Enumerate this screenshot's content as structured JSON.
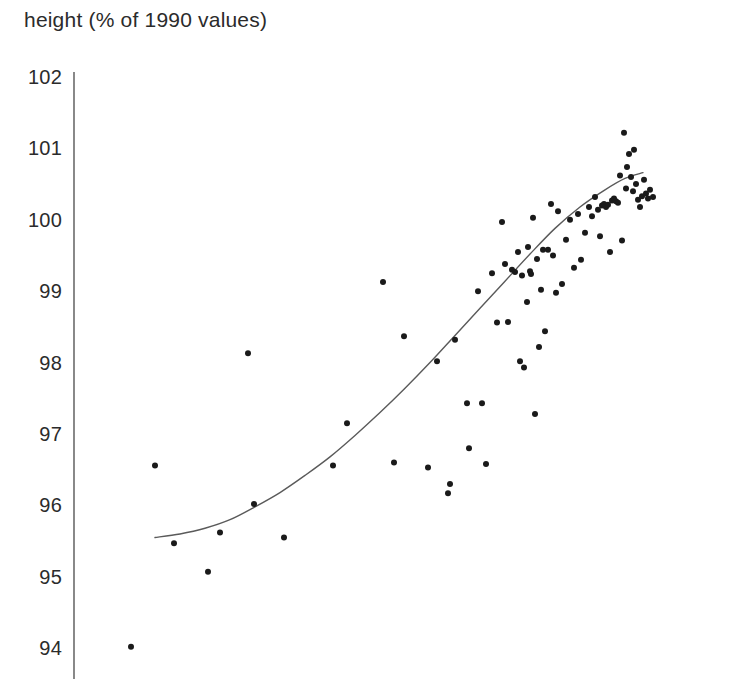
{
  "chart_data": {
    "type": "scatter",
    "title": "height (% of 1990 values)",
    "ylabel": "height (% of 1990 values)",
    "xlabel": "",
    "ylim": [
      93.6,
      102.3
    ],
    "yticks": [
      102,
      101,
      100,
      99,
      98,
      97,
      96,
      95,
      94
    ],
    "ytick_labels": [
      "102",
      "101",
      "100",
      "99",
      "98",
      "97",
      "96",
      "95",
      "94"
    ],
    "grid": false,
    "legend": null,
    "axis": {
      "y_axis_visible": true,
      "x_axis_visible": false,
      "x_ticks_visible": false
    },
    "marker": {
      "shape": "circle",
      "color": "#1a1a1a",
      "size_px": 6
    },
    "series": [
      {
        "name": "observations",
        "type": "scatter",
        "points": [
          [
            131,
            94.02
          ],
          [
            155,
            96.56
          ],
          [
            174,
            95.47
          ],
          [
            208,
            95.07
          ],
          [
            220,
            95.62
          ],
          [
            248,
            98.13
          ],
          [
            254,
            96.02
          ],
          [
            284,
            95.55
          ],
          [
            333,
            96.56
          ],
          [
            347,
            97.15
          ],
          [
            383,
            99.13
          ],
          [
            394,
            96.6
          ],
          [
            404,
            98.37
          ],
          [
            428,
            96.53
          ],
          [
            437,
            98.02
          ],
          [
            448,
            96.17
          ],
          [
            450,
            96.3
          ],
          [
            455,
            98.32
          ],
          [
            467,
            97.43
          ],
          [
            469,
            96.8
          ],
          [
            478,
            99.0
          ],
          [
            482,
            97.43
          ],
          [
            486,
            96.58
          ],
          [
            492,
            99.25
          ],
          [
            497,
            98.56
          ],
          [
            502,
            99.97
          ],
          [
            505,
            99.38
          ],
          [
            508,
            98.57
          ],
          [
            512,
            99.3
          ],
          [
            515,
            99.27
          ],
          [
            518,
            99.55
          ],
          [
            520,
            98.02
          ],
          [
            522,
            99.22
          ],
          [
            524,
            97.93
          ],
          [
            527,
            98.85
          ],
          [
            528,
            99.62
          ],
          [
            530,
            99.28
          ],
          [
            531,
            99.24
          ],
          [
            533,
            100.03
          ],
          [
            535,
            97.28
          ],
          [
            537,
            99.45
          ],
          [
            539,
            98.22
          ],
          [
            541,
            99.02
          ],
          [
            543,
            99.58
          ],
          [
            545,
            98.44
          ],
          [
            548,
            99.58
          ],
          [
            551,
            100.22
          ],
          [
            553,
            99.5
          ],
          [
            556,
            98.98
          ],
          [
            558,
            100.12
          ],
          [
            562,
            99.1
          ],
          [
            566,
            99.72
          ],
          [
            570,
            100.0
          ],
          [
            574,
            99.33
          ],
          [
            578,
            100.08
          ],
          [
            581,
            99.44
          ],
          [
            585,
            99.82
          ],
          [
            589,
            100.18
          ],
          [
            592,
            100.05
          ],
          [
            595,
            100.32
          ],
          [
            598,
            100.14
          ],
          [
            600,
            99.77
          ],
          [
            602,
            100.2
          ],
          [
            604,
            100.22
          ],
          [
            606,
            100.18
          ],
          [
            608,
            100.21
          ],
          [
            610,
            99.55
          ],
          [
            612,
            100.27
          ],
          [
            614,
            100.3
          ],
          [
            616,
            100.26
          ],
          [
            618,
            100.24
          ],
          [
            620,
            100.62
          ],
          [
            622,
            99.71
          ],
          [
            624,
            101.22
          ],
          [
            626,
            100.44
          ],
          [
            627,
            100.74
          ],
          [
            629,
            100.92
          ],
          [
            631,
            100.6
          ],
          [
            633,
            100.4
          ],
          [
            634,
            100.98
          ],
          [
            636,
            100.5
          ],
          [
            638,
            100.28
          ],
          [
            640,
            100.18
          ],
          [
            642,
            100.33
          ],
          [
            644,
            100.56
          ],
          [
            646,
            100.37
          ],
          [
            648,
            100.3
          ],
          [
            650,
            100.42
          ],
          [
            653,
            100.32
          ]
        ]
      },
      {
        "name": "fitted-trend",
        "type": "line",
        "color": "#5a5a5a",
        "points": [
          [
            155,
            95.55
          ],
          [
            180,
            95.6
          ],
          [
            205,
            95.68
          ],
          [
            230,
            95.8
          ],
          [
            255,
            95.98
          ],
          [
            280,
            96.18
          ],
          [
            305,
            96.42
          ],
          [
            330,
            96.68
          ],
          [
            355,
            96.98
          ],
          [
            380,
            97.3
          ],
          [
            405,
            97.64
          ],
          [
            430,
            98.0
          ],
          [
            455,
            98.38
          ],
          [
            480,
            98.76
          ],
          [
            505,
            99.14
          ],
          [
            530,
            99.52
          ],
          [
            555,
            99.88
          ],
          [
            580,
            100.18
          ],
          [
            605,
            100.42
          ],
          [
            625,
            100.58
          ],
          [
            643,
            100.66
          ]
        ]
      }
    ]
  },
  "layout": {
    "plot_left_px": 74,
    "plot_top_px": 72,
    "plot_bottom_px": 679,
    "y_top_value": 102.0,
    "y_top_px": 77,
    "px_per_unit": 71.4
  }
}
